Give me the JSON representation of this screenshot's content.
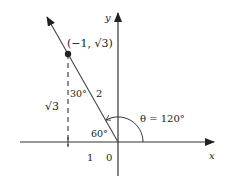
{
  "diagram": {
    "title": "",
    "axes": {
      "x_label": "x",
      "y_label": "y",
      "origin_label": "0"
    },
    "point": {
      "label": "(−1, √3)",
      "coords": [
        -1,
        1.732
      ]
    },
    "segments": {
      "hypotenuse_label": "2",
      "vertical_leg_label": "√3",
      "horizontal_leg_label": "1"
    },
    "angles": {
      "top_angle": "30°",
      "reference_angle": "60°",
      "theta": "θ = 120°"
    },
    "colors": {
      "stroke": "#333333",
      "point": "#222222",
      "background": "#ffffff"
    }
  }
}
